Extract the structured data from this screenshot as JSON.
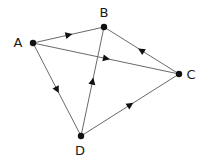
{
  "diagram": {
    "type": "directed-graph",
    "nodes": [
      {
        "id": "A",
        "label": "A",
        "x": 33,
        "y": 43,
        "label_x": 18,
        "label_y": 47
      },
      {
        "id": "B",
        "label": "B",
        "x": 104,
        "y": 27,
        "label_x": 104,
        "label_y": 17
      },
      {
        "id": "C",
        "label": "C",
        "x": 179,
        "y": 74,
        "label_x": 191,
        "label_y": 79
      },
      {
        "id": "D",
        "label": "D",
        "x": 81,
        "y": 136,
        "label_x": 80,
        "label_y": 155
      }
    ],
    "edges": [
      {
        "from": "A",
        "to": "B"
      },
      {
        "from": "A",
        "to": "C"
      },
      {
        "from": "C",
        "to": "B"
      },
      {
        "from": "A",
        "to": "D"
      },
      {
        "from": "D",
        "to": "B"
      },
      {
        "from": "D",
        "to": "C"
      }
    ],
    "colors": {
      "edge": "#6a6a6a",
      "node": "#111111",
      "label": "#1a1a1a"
    }
  }
}
